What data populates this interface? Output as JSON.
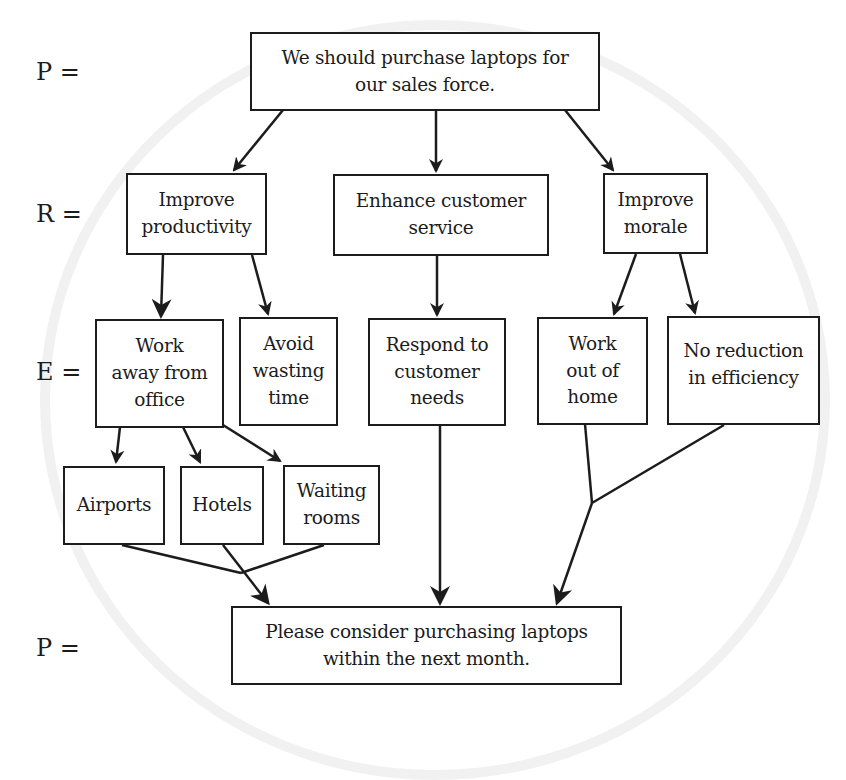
{
  "diagram": {
    "type": "argument-flowchart",
    "row_labels": {
      "premise_top": "P =",
      "reasons": "R =",
      "evidence": "E =",
      "premise_bottom": "P ="
    },
    "nodes": {
      "main_point": "We should purchase laptops for\nour sales force.",
      "reason_productivity": "Improve\nproductivity",
      "reason_service": "Enhance customer\nservice",
      "reason_morale": "Improve\nmorale",
      "evidence_work_away": "Work\naway from\noffice",
      "evidence_avoid_waste": "Avoid\nwasting\ntime",
      "evidence_respond": "Respond to\ncustomer\nneeds",
      "evidence_work_home": "Work\nout of\nhome",
      "evidence_no_reduction": "No reduction\nin efficiency",
      "sub_airports": "Airports",
      "sub_hotels": "Hotels",
      "sub_waiting_rooms": "Waiting\nrooms",
      "conclusion": "Please consider purchasing laptops\nwithin the next month."
    },
    "edges": [
      {
        "from": "main_point",
        "to": "reason_productivity"
      },
      {
        "from": "main_point",
        "to": "reason_service"
      },
      {
        "from": "main_point",
        "to": "reason_morale"
      },
      {
        "from": "reason_productivity",
        "to": "evidence_work_away"
      },
      {
        "from": "reason_productivity",
        "to": "evidence_avoid_waste"
      },
      {
        "from": "reason_service",
        "to": "evidence_respond"
      },
      {
        "from": "reason_morale",
        "to": "evidence_work_home"
      },
      {
        "from": "reason_morale",
        "to": "evidence_no_reduction"
      },
      {
        "from": "evidence_work_away",
        "to": "sub_airports"
      },
      {
        "from": "evidence_work_away",
        "to": "sub_hotels"
      },
      {
        "from": "evidence_work_away",
        "to": "sub_waiting_rooms"
      },
      {
        "from": [
          "sub_airports",
          "sub_hotels",
          "sub_waiting_rooms"
        ],
        "to": "conclusion"
      },
      {
        "from": "evidence_respond",
        "to": "conclusion"
      },
      {
        "from": [
          "evidence_work_home",
          "evidence_no_reduction"
        ],
        "to": "conclusion"
      }
    ],
    "colors": {
      "stroke": "#1c1c1c",
      "background": "#ffffff"
    }
  }
}
